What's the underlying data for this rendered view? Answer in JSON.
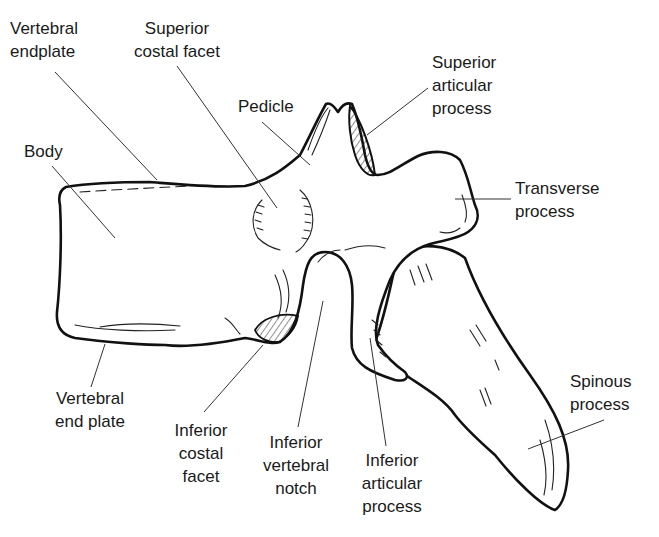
{
  "diagram": {
    "labels": [
      {
        "id": "vertebral-endplate",
        "lines": [
          "Vertebral",
          "endplate"
        ]
      },
      {
        "id": "superior-costal-facet",
        "lines": [
          "Superior",
          "costal facet"
        ]
      },
      {
        "id": "pedicle",
        "lines": [
          "Pedicle"
        ]
      },
      {
        "id": "superior-articular-process",
        "lines": [
          "Superior",
          "articular",
          "process"
        ]
      },
      {
        "id": "body",
        "lines": [
          "Body"
        ]
      },
      {
        "id": "transverse-process",
        "lines": [
          "Transverse",
          "process"
        ]
      },
      {
        "id": "vertebral-end-plate",
        "lines": [
          "Vertebral",
          "end plate"
        ]
      },
      {
        "id": "inferior-costal-facet",
        "lines": [
          "Inferior",
          "costal",
          "facet"
        ]
      },
      {
        "id": "inferior-vertebral-notch",
        "lines": [
          "Inferior",
          "vertebral",
          "notch"
        ]
      },
      {
        "id": "inferior-articular-process",
        "lines": [
          "Inferior",
          "articular",
          "process"
        ]
      },
      {
        "id": "spinous-process",
        "lines": [
          "Spinous",
          "process"
        ]
      }
    ]
  },
  "text": {
    "vertebral_endplate": "Vertebral\nendplate",
    "superior_costal_facet": "Superior\ncostal facet",
    "pedicle": "Pedicle",
    "superior_articular_process": "Superior\narticular\nprocess",
    "body": "Body",
    "transverse_process": "Transverse\nprocess",
    "vertebral_end_plate": "Vertebral\nend plate",
    "inferior_costal_facet": "Inferior\ncostal\nfacet",
    "inferior_vertebral_notch": "Inferior\nvertebral\nnotch",
    "inferior_articular_process": "Inferior\narticular\nprocess",
    "spinous_process": "Spinous\nprocess"
  },
  "colors": {
    "line": "#111111",
    "text": "#1a1a1a",
    "background": "#ffffff"
  }
}
